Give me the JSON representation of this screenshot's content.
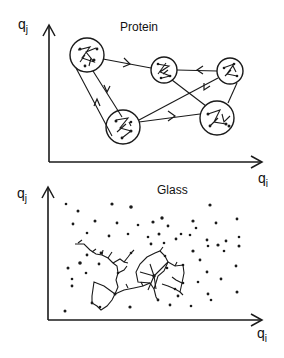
{
  "panels": [
    {
      "title": "Protein",
      "y_axis_label": "q",
      "y_axis_sub": "j",
      "x_axis_label": "q",
      "x_axis_sub": "i",
      "states": [
        {
          "id": "A",
          "cx": 87,
          "cy": 55,
          "r": 17
        },
        {
          "id": "B",
          "cx": 164,
          "cy": 70,
          "r": 13
        },
        {
          "id": "C",
          "cx": 230,
          "cy": 71,
          "r": 13
        },
        {
          "id": "D",
          "cx": 123,
          "cy": 127,
          "r": 17
        },
        {
          "id": "E",
          "cx": 217,
          "cy": 118,
          "r": 17
        }
      ],
      "transitions": [
        {
          "from": "A",
          "to": "B"
        },
        {
          "from": "C",
          "to": "B"
        },
        {
          "from": "A",
          "to": "D"
        },
        {
          "from": "D",
          "to": "A"
        },
        {
          "from": "D",
          "to": "E"
        },
        {
          "from": "D",
          "to": "C"
        },
        {
          "from": "B",
          "to": "E"
        },
        {
          "from": "C",
          "to": "E"
        }
      ]
    },
    {
      "title": "Glass",
      "y_axis_label": "q",
      "y_axis_sub": "j",
      "x_axis_label": "q",
      "x_axis_sub": "i"
    }
  ],
  "colors": {
    "ink": "#1a1a1a",
    "background": "#ffffff"
  }
}
